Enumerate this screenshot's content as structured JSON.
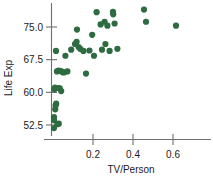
{
  "chart_data": {
    "type": "scatter",
    "title": "",
    "xlabel": "TV/Person",
    "ylabel": "Life Exp",
    "xlim": [
      -0.02,
      0.78
    ],
    "ylim": [
      49.0,
      80.5
    ],
    "xticks": [
      0.2,
      0.4,
      0.6
    ],
    "xticklabels": [
      "0.2",
      "0.4",
      "0.6"
    ],
    "yticks": [
      52.5,
      60.0,
      67.5,
      75.0
    ],
    "yticklabels": [
      "52.5",
      "60.0",
      "67.5",
      "75.0"
    ],
    "grid": false,
    "legend": false,
    "marker_color": "#2e6b41",
    "marker_size": 3.1,
    "points": [
      {
        "x": 0.005,
        "y": 51.8
      },
      {
        "x": 0.005,
        "y": 53.6
      },
      {
        "x": 0.005,
        "y": 54.3
      },
      {
        "x": 0.011,
        "y": 56.1
      },
      {
        "x": 0.013,
        "y": 57.0
      },
      {
        "x": 0.016,
        "y": 57.4
      },
      {
        "x": 0.022,
        "y": 52.7
      },
      {
        "x": 0.029,
        "y": 52.8
      },
      {
        "x": 0.007,
        "y": 60.7
      },
      {
        "x": 0.01,
        "y": 61.1
      },
      {
        "x": 0.028,
        "y": 61.0
      },
      {
        "x": 0.034,
        "y": 60.9
      },
      {
        "x": 0.041,
        "y": 60.3
      },
      {
        "x": 0.02,
        "y": 64.8
      },
      {
        "x": 0.028,
        "y": 65.0
      },
      {
        "x": 0.04,
        "y": 64.9
      },
      {
        "x": 0.048,
        "y": 64.6
      },
      {
        "x": 0.057,
        "y": 64.6
      },
      {
        "x": 0.072,
        "y": 64.8
      },
      {
        "x": 0.015,
        "y": 69.5
      },
      {
        "x": 0.062,
        "y": 68.4
      },
      {
        "x": 0.091,
        "y": 69.8
      },
      {
        "x": 0.11,
        "y": 71.1
      },
      {
        "x": 0.118,
        "y": 71.6
      },
      {
        "x": 0.12,
        "y": 74.4
      },
      {
        "x": 0.128,
        "y": 70.4
      },
      {
        "x": 0.136,
        "y": 70.0
      },
      {
        "x": 0.152,
        "y": 69.5
      },
      {
        "x": 0.165,
        "y": 64.3
      },
      {
        "x": 0.182,
        "y": 69.6
      },
      {
        "x": 0.196,
        "y": 73.2
      },
      {
        "x": 0.205,
        "y": 68.4
      },
      {
        "x": 0.218,
        "y": 78.4
      },
      {
        "x": 0.238,
        "y": 75.6
      },
      {
        "x": 0.245,
        "y": 69.8
      },
      {
        "x": 0.258,
        "y": 76.2
      },
      {
        "x": 0.262,
        "y": 71.1
      },
      {
        "x": 0.272,
        "y": 75.3
      },
      {
        "x": 0.283,
        "y": 69.5
      },
      {
        "x": 0.3,
        "y": 78.5
      },
      {
        "x": 0.301,
        "y": 77.9
      },
      {
        "x": 0.308,
        "y": 75.8
      },
      {
        "x": 0.322,
        "y": 70.0
      },
      {
        "x": 0.455,
        "y": 79.0
      },
      {
        "x": 0.465,
        "y": 76.2
      },
      {
        "x": 0.615,
        "y": 75.3
      }
    ]
  },
  "axes": {
    "x_axis_name": "TV/Person",
    "y_axis_name": "Life Exp"
  }
}
